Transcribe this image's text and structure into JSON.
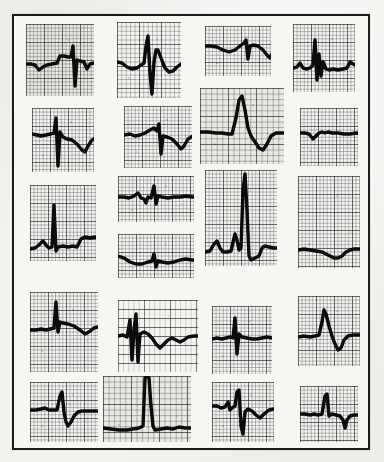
{
  "figure": {
    "kind": "ecg-strip-panel",
    "caption": "",
    "background_color": "#f3f2ef",
    "frame_color": "#1b1b1b",
    "paper_color": "#f7f6f3",
    "trace_color": "#0b0b0b",
    "grid_major_color": "#282830",
    "grid_minor_color": "#19191e",
    "rows": 5,
    "columns": 4,
    "total_strips": 20
  },
  "strips": [
    {
      "id": "strip-r1c1",
      "row": 1,
      "column": 1,
      "x": 26,
      "y": 24,
      "width": 68,
      "height": 72,
      "grid_scale": "fine",
      "tint": "tint-warm",
      "morphology": "narrow QRS with deep S, flat baseline, two complexes",
      "baseline_y": 40,
      "path": "M0,40 L5,40 L9,41 L13,46 L17,43 L21,41 L26,40 L31,39 L34,32 L38,32 L42,33 L45,33 L47,22 L49,62 L51,36 L54,37 L58,38 L61,45 L64,40 L68,39 L72,39 L78,39"
    },
    {
      "id": "strip-r1c2",
      "row": 1,
      "column": 2,
      "x": 117,
      "y": 22,
      "width": 64,
      "height": 76,
      "grid_scale": "normal",
      "tint": "tint-light",
      "morphology": "tall R wave, deep S, broad negative T wave",
      "baseline_y": 40,
      "path": "M0,40 L5,41 L10,45 L15,47 L20,46 L24,43 L27,41 L29,24 L31,14 L33,52 L35,72 L37,40 L39,28 L41,28 L44,36 L48,46 L52,50 L56,49 L60,45 L64,42 L68,41"
    },
    {
      "id": "strip-r1c3",
      "row": 1,
      "column": 3,
      "x": 205,
      "y": 26,
      "width": 66,
      "height": 50,
      "grid_scale": "fine",
      "tint": "tint-light",
      "morphology": "low amplitude rising baseline with notched small QRS",
      "baseline_y": 22,
      "path": "M0,20 L6,20 L12,21 L18,24 L24,26 L30,24 L35,20 L39,17 L41,14 L43,33 L45,20 L48,19 L53,20 L58,24 L62,29 L65,32 L68,26 L72,21 L76,22"
    },
    {
      "id": "strip-r1c4",
      "row": 1,
      "column": 4,
      "x": 293,
      "y": 24,
      "width": 62,
      "height": 68,
      "grid_scale": "fine",
      "tint": "tint-light",
      "morphology": "sharp biphasic spike with wide QRS, flat baseline after",
      "baseline_y": 42,
      "path": "M0,44 L4,43 L7,39 L10,44 L14,45 L17,44 L20,41 L22,16 L24,56 L26,30 L28,52 L30,38 L33,45 L36,46 L40,45 L45,46 L50,45 L54,44 L57,38 L60,40 L64,42 L68,42"
    },
    {
      "id": "strip-r2c1",
      "row": 2,
      "column": 1,
      "x": 32,
      "y": 108,
      "width": 62,
      "height": 64,
      "grid_scale": "fine",
      "tint": "tint-light",
      "morphology": "tall narrow spike with very deep S, broad negative T",
      "baseline_y": 26,
      "path": "M0,26 L5,27 L9,28 L14,27 L18,26 L22,25 L24,10 L26,58 L28,24 L31,29 L35,31 L40,32 L45,36 L50,42 L53,44 L56,38 L60,32 L64,30 L68,30"
    },
    {
      "id": "strip-r2c2",
      "row": 2,
      "column": 2,
      "x": 124,
      "y": 106,
      "width": 68,
      "height": 62,
      "grid_scale": "fine",
      "tint": "tint-light",
      "morphology": "low voltage with small spike and deep broad T wave trough",
      "baseline_y": 28,
      "path": "M0,29 L6,28 L11,30 L16,29 L21,27 L26,24 L30,22 L33,25 L35,18 L37,48 L39,30 L43,31 L48,33 L53,38 L57,43 L60,40 L64,33 L69,30 L74,30"
    },
    {
      "id": "strip-r2c3",
      "row": 2,
      "column": 3,
      "x": 200,
      "y": 88,
      "width": 84,
      "height": 76,
      "grid_scale": "coarse",
      "tint": "tint-warm",
      "morphology": "very tall peaked R wave with deep inverted T wave",
      "baseline_y": 44,
      "path": "M0,44 L8,44 L16,45 L22,45 L28,46 L32,46 L36,30 L39,12 L42,8 L45,22 L48,40 L51,48 L55,54 L59,60 L63,62 L67,56 L71,48 L76,45 L82,45 L88,45"
    },
    {
      "id": "strip-r2c4",
      "row": 2,
      "column": 4,
      "x": 300,
      "y": 108,
      "width": 58,
      "height": 58,
      "grid_scale": "fine",
      "tint": "tint-light",
      "morphology": "flat baseline with small notched complex, low amplitude",
      "baseline_y": 26,
      "path": "M0,25 L5,25 L9,26 L13,31 L16,28 L19,25 L22,24 L25,25 L28,24 L32,25 L38,25 L44,26 L50,26 L56,25 L62,26"
    },
    {
      "id": "strip-r3c1",
      "row": 3,
      "column": 1,
      "x": 30,
      "y": 185,
      "width": 66,
      "height": 76,
      "grid_scale": "fine",
      "tint": "tint-light",
      "morphology": "tall spike early then step-up elevated baseline plateau",
      "baseline_y": 62,
      "path": "M0,64 L5,63 L9,60 L13,56 L16,60 L19,63 L22,62 L24,20 L26,66 L28,62 L33,61 L38,62 L43,61 L47,62 L51,54 L55,52 L60,53 L65,52 L70,53"
    },
    {
      "id": "strip-r3c2a",
      "row": 3,
      "column": 2,
      "x": 118,
      "y": 176,
      "width": 76,
      "height": 46,
      "grid_scale": "fine",
      "tint": "tint-light",
      "morphology": "flat baseline with small sharp spike and low QRS",
      "baseline_y": 22,
      "path": "M0,21 L6,21 L11,22 L16,20 L20,17 L23,22 L26,23 L28,27 L30,21 L33,22 L36,10 L38,28 L40,20 L44,21 L50,22 L56,21 L62,21 L68,20 L74,21 L80,21"
    },
    {
      "id": "strip-r3c2b",
      "row": 3,
      "column": 2,
      "x": 118,
      "y": 234,
      "width": 76,
      "height": 44,
      "grid_scale": "fine",
      "tint": "tint-light",
      "morphology": "undulating low amplitude baseline with tiny spike",
      "baseline_y": 26,
      "path": "M0,22 L6,24 L12,28 L18,30 L24,30 L30,28 L34,27 L36,20 L38,33 L40,27 L44,28 L50,29 L56,28 L62,26 L68,25 L74,26 L80,26"
    },
    {
      "id": "strip-r3c3",
      "row": 3,
      "column": 3,
      "x": 205,
      "y": 170,
      "width": 72,
      "height": 96,
      "grid_scale": "fine",
      "tint": "tint-light",
      "morphology": "very tall full height R spike, preceding small beat, deep trough",
      "baseline_y": 82,
      "path": "M0,82 L5,81 L9,74 L12,71 L15,78 L18,82 L22,82 L26,81 L30,64 L32,70 L34,80 L36,78 L38,20 L40,4 L42,40 L44,86 L46,90 L50,88 L54,86 L57,78 L60,76 L64,77 L68,78 L74,78"
    },
    {
      "id": "strip-r3c4",
      "row": 3,
      "column": 4,
      "x": 298,
      "y": 176,
      "width": 62,
      "height": 92,
      "grid_scale": "fine",
      "tint": "tint-light",
      "morphology": "faint tall artifact spike with low baseline and shallow dip",
      "baseline_y": 74,
      "path": "M0,74 L6,73 L12,74 L18,75 L24,76 L28,78 L32,80 L36,82 L40,82 L44,80 L48,76 L52,74 L56,73 L62,73"
    },
    {
      "id": "strip-r4c1",
      "row": 4,
      "column": 1,
      "x": 30,
      "y": 292,
      "width": 68,
      "height": 80,
      "grid_scale": "fine",
      "tint": "tint-light",
      "morphology": "tall narrow R spike, flat baseline, gentle late dip",
      "baseline_y": 38,
      "path": "M0,38 L6,38 L11,37 L16,38 L20,37 L24,36 L26,10 L28,40 L30,30 L33,31 L38,32 L44,34 L50,38 L55,42 L59,40 L64,36 L68,35 L72,35"
    },
    {
      "id": "strip-r4c2",
      "row": 4,
      "column": 2,
      "x": 118,
      "y": 300,
      "width": 80,
      "height": 72,
      "grid_scale": "wideband",
      "tint": "tint-light",
      "morphology": "wide-banded paper, sharp biphasic spike then broad negative wave",
      "baseline_y": 36,
      "path": "M0,36 L5,35 L9,37 L12,20 L14,60 L16,30 L18,14 L20,62 L22,34 L26,32 L30,34 L34,38 L38,44 L42,48 L46,44 L50,40 L54,38 L58,40 L62,42 L66,40 L70,37 L76,36 L82,36"
    },
    {
      "id": "strip-r4c3",
      "row": 4,
      "column": 3,
      "x": 212,
      "y": 306,
      "width": 60,
      "height": 68,
      "grid_scale": "fine",
      "tint": "tint-light",
      "morphology": "thick flat baseline with narrow spike and faint trailing artifact",
      "baseline_y": 32,
      "path": "M0,33 L5,32 L10,33 L14,32 L18,31 L21,32 L23,12 L25,48 L27,28 L30,31 L35,32 L40,33 L45,33 L50,32 L55,31 L60,32 L64,32"
    },
    {
      "id": "strip-r4c4",
      "row": 4,
      "column": 4,
      "x": 298,
      "y": 296,
      "width": 62,
      "height": 70,
      "grid_scale": "fine",
      "tint": "tint-light",
      "morphology": "peaked R wave with deep inverted T trough and recovery",
      "baseline_y": 40,
      "path": "M0,41 L6,40 L12,41 L17,40 L21,39 L24,26 L26,14 L28,18 L31,30 L34,40 L37,48 L40,54 L43,52 L46,44 L50,40 L55,39 L60,39 L64,39"
    },
    {
      "id": "strip-r5c1",
      "row": 5,
      "column": 1,
      "x": 30,
      "y": 382,
      "width": 68,
      "height": 60,
      "grid_scale": "fine",
      "tint": "tint-light",
      "morphology": "flat thick baseline, tall narrow spike, sharp V-shaped trough",
      "baseline_y": 28,
      "path": "M0,28 L6,28 L11,27 L15,26 L19,28 L23,28 L27,28 L30,14 L32,10 L34,30 L36,40 L38,44 L41,40 L44,34 L48,30 L52,29 L58,29 L64,29 L70,29"
    },
    {
      "id": "strip-r5c2",
      "row": 5,
      "column": 2,
      "x": 103,
      "y": 376,
      "width": 88,
      "height": 66,
      "grid_scale": "coarse",
      "tint": "tint-warm",
      "morphology": "off-scale tall spike clipped at top, low flat baseline, plateau after",
      "baseline_y": 52,
      "path": "M0,52 L8,53 L16,54 L24,54 L30,53 L36,52 L40,50 L42,2 L44,0 L46,2 L48,30 L50,50 L52,54 L58,53 L64,52 L70,53 L76,51 L82,52 L90,52"
    },
    {
      "id": "strip-r5c3",
      "row": 5,
      "column": 3,
      "x": 212,
      "y": 382,
      "width": 62,
      "height": 60,
      "grid_scale": "fine",
      "tint": "tint-light",
      "morphology": "small notched complex then tall R, deep S, shallow recovery dip",
      "baseline_y": 26,
      "path": "M0,24 L5,24 L9,26 L13,25 L16,20 L18,28 L20,26 L23,24 L25,10 L27,8 L29,44 L31,52 L33,30 L36,27 L40,29 L44,33 L48,36 L52,32 L57,28 L62,27 L66,27"
    },
    {
      "id": "strip-r5c4",
      "row": 5,
      "column": 4,
      "x": 300,
      "y": 386,
      "width": 58,
      "height": 56,
      "grid_scale": "fine",
      "tint": "tint-light",
      "morphology": "flat baseline, tall thin spike, then sharp downward deflection",
      "baseline_y": 28,
      "path": "M0,28 L5,28 L10,29 L14,28 L18,29 L22,28 L25,10 L27,8 L29,30 L32,28 L36,29 L40,30 L43,34 L45,42 L47,34 L50,30 L54,29 L60,29"
    }
  ]
}
